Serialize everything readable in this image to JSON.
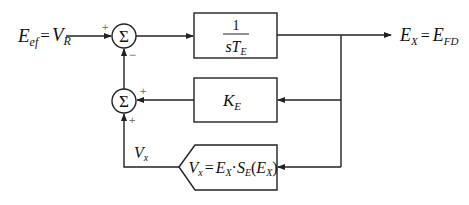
{
  "diagram": {
    "input_label": {
      "main": "E",
      "sub": "ef",
      "eq": "=",
      "rhs": "V",
      "rhs_sub": "R"
    },
    "output_label": {
      "main": "E",
      "sub": "X",
      "eq": "=",
      "rhs": "E",
      "rhs_sub": "FD"
    },
    "summer_top": {
      "symbol": "Σ",
      "sign_input": "+",
      "sign_feedback": "−"
    },
    "summer_bottom": {
      "symbol": "Σ",
      "sign_ke": "+",
      "sign_vx": "+"
    },
    "block_integrator": {
      "numerator": "1",
      "denominator_s": "s",
      "denominator_T": "T",
      "denominator_sub": "E"
    },
    "block_gain": {
      "main": "K",
      "sub": "E"
    },
    "block_saturation": {
      "lhs": "V",
      "lhs_sub": "x",
      "eq": "=",
      "t1": "E",
      "t1_sub": "X",
      "dot": "·",
      "t2": "S",
      "t2_sub": "E",
      "paren_open": "(",
      "t3": "E",
      "t3_sub": "X",
      "paren_close": ")"
    },
    "feedback_label": {
      "main": "V",
      "sub": "x"
    }
  }
}
